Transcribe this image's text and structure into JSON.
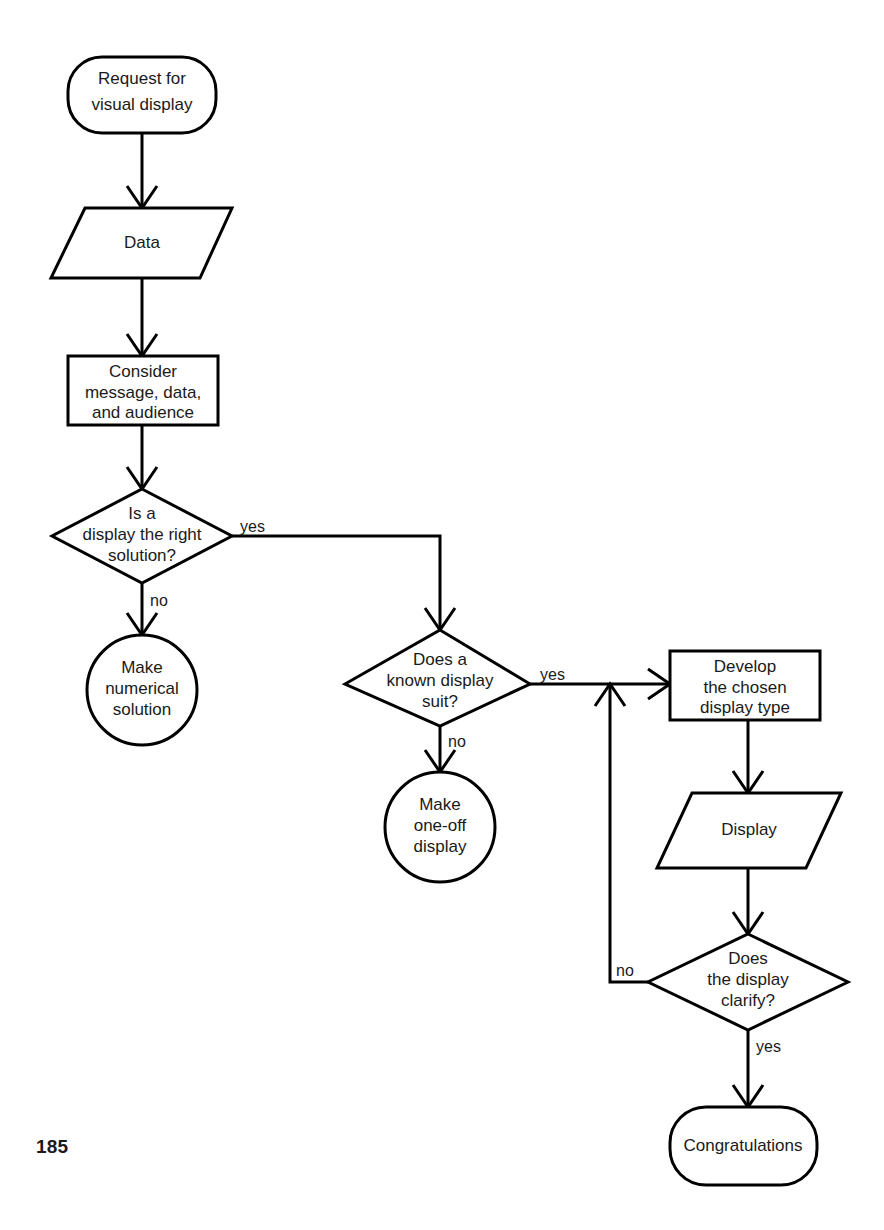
{
  "page": {
    "number": "185",
    "background_color": "#ffffff",
    "line_color": "#000000",
    "text_color": "#1a1a1a"
  },
  "diagram": {
    "type": "flowchart",
    "nodes": [
      {
        "id": "start",
        "shape": "terminator",
        "lines": [
          "Request for",
          "visual display"
        ]
      },
      {
        "id": "data-in",
        "shape": "parallelogram",
        "lines": [
          "Data"
        ]
      },
      {
        "id": "consider",
        "shape": "process",
        "lines": [
          "Consider",
          "message, data,",
          "and audience"
        ]
      },
      {
        "id": "is-display-right",
        "shape": "decision",
        "lines": [
          "Is a",
          "display the right",
          "solution?"
        ]
      },
      {
        "id": "make-numerical",
        "shape": "circle",
        "lines": [
          "Make",
          "numerical",
          "solution"
        ]
      },
      {
        "id": "known-display-suit",
        "shape": "decision",
        "lines": [
          "Does a",
          "known display",
          "suit?"
        ]
      },
      {
        "id": "make-one-off",
        "shape": "circle",
        "lines": [
          "Make",
          "one-off",
          "display"
        ]
      },
      {
        "id": "develop-chosen",
        "shape": "process",
        "lines": [
          "Develop",
          "the chosen",
          "display type"
        ]
      },
      {
        "id": "display-out",
        "shape": "parallelogram",
        "lines": [
          "Display"
        ]
      },
      {
        "id": "display-clarify",
        "shape": "decision",
        "lines": [
          "Does",
          "the display",
          "clarify?"
        ]
      },
      {
        "id": "congratulations",
        "shape": "terminator",
        "lines": [
          "Congratulations"
        ]
      }
    ],
    "edge_labels": {
      "is_display_right_yes": "yes",
      "is_display_right_no": "no",
      "known_display_yes": "yes",
      "known_display_no": "no",
      "clarify_no": "no",
      "clarify_yes": "yes"
    }
  }
}
